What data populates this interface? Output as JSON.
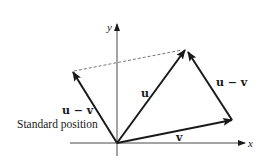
{
  "diagram": {
    "axes": {
      "x_label": "x",
      "y_label": "y"
    },
    "vectors": {
      "u": {
        "label": "u",
        "from": [
          117,
          143
        ],
        "to": [
          185,
          50
        ]
      },
      "v": {
        "label": "v",
        "from": [
          117,
          143
        ],
        "to": [
          232,
          120
        ]
      },
      "u_minus_v_translated": {
        "label": "u − v",
        "from": [
          232,
          120
        ],
        "to": [
          188,
          52
        ]
      },
      "u_minus_v_standard": {
        "label": "u − v",
        "from": [
          117,
          143
        ],
        "to": [
          73,
          72
        ]
      }
    },
    "annotations": {
      "standard_position": "Standard position"
    },
    "colors": {
      "ink": "#1a1a1a",
      "dashed": "#555555"
    }
  }
}
